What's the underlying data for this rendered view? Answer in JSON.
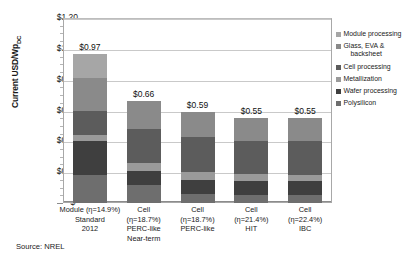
{
  "chart_data": {
    "type": "bar",
    "subtype": "stacked-bar",
    "title": "",
    "xlabel": "",
    "ylabel": "Current USD/Wp",
    "ylabel_subscript": "DC",
    "ylim": [
      0,
      1.2
    ],
    "ytick_values": [
      0,
      0.2,
      0.4,
      0.6,
      0.8,
      1.0,
      1.2
    ],
    "ytick_labels": [
      "$-",
      "$0.20",
      "$0.40",
      "$0.60",
      "$0.80",
      "$1.00",
      "$1.20"
    ],
    "grid": true,
    "legend_position": "right",
    "categories": [
      "Module (η=14.9%) Standard 2012",
      "Cell (η=18.7%) PERC-like Near-term",
      "Cell (η=18.7%) PERC-like",
      "Cell (η=21.4%) HIT",
      "Cell (η=22.4%) IBC"
    ],
    "category_lines": [
      [
        "Module (η=14.9%)",
        "Standard",
        "2012"
      ],
      [
        "Cell",
        "(η=18.7%)",
        "PERC-like",
        "Near-term"
      ],
      [
        "Cell",
        "(η=18.7%)",
        "PERC-like"
      ],
      [
        "Cell",
        "(η=21.4%)",
        "HIT"
      ],
      [
        "Cell",
        "(η=22.4%)",
        "IBC"
      ]
    ],
    "totals": [
      0.97,
      0.66,
      0.59,
      0.55,
      0.55
    ],
    "total_labels": [
      "$0.97",
      "$0.66",
      "$0.59",
      "$0.55",
      "$0.55"
    ],
    "series": [
      {
        "name": "Polysilicon",
        "color": "#6e6e6e",
        "values": [
          0.18,
          0.12,
          0.06,
          0.05,
          0.05
        ]
      },
      {
        "name": "Wafer processing",
        "color": "#3f3f3f",
        "values": [
          0.22,
          0.09,
          0.09,
          0.09,
          0.09
        ]
      },
      {
        "name": "Metallization",
        "color": "#9a9a9a",
        "values": [
          0.04,
          0.05,
          0.05,
          0.05,
          0.04
        ]
      },
      {
        "name": "Cell processing",
        "color": "#5c5c5c",
        "values": [
          0.16,
          0.22,
          0.23,
          0.21,
          0.22
        ]
      },
      {
        "name": "Glass, EVA & backsheet",
        "color": "#8a8a8a",
        "values": [
          0.21,
          0.18,
          0.16,
          0.15,
          0.15
        ]
      },
      {
        "name": "Module processing",
        "color": "#a6a6a6",
        "values": [
          0.16,
          0.0,
          0.0,
          0.0,
          0.0
        ]
      }
    ],
    "legend_entries": [
      {
        "label": "Module processing",
        "label_lines": [
          "Module processing"
        ],
        "color": "#a6a6a6"
      },
      {
        "label": "Glass, EVA & backsheet",
        "label_lines": [
          "Glass, EVA &",
          "backsheet"
        ],
        "color": "#8a8a8a"
      },
      {
        "label": "Cell processing",
        "label_lines": [
          "Cell processing"
        ],
        "color": "#5c5c5c"
      },
      {
        "label": "Metallization",
        "label_lines": [
          "Metallization"
        ],
        "color": "#9a9a9a"
      },
      {
        "label": "Wafer processing",
        "label_lines": [
          "Wafer processing"
        ],
        "color": "#3f3f3f"
      },
      {
        "label": "Polysilicon",
        "label_lines": [
          "Polysilicon"
        ],
        "color": "#6e6e6e"
      }
    ]
  },
  "source": {
    "text": "Source: NREL"
  }
}
